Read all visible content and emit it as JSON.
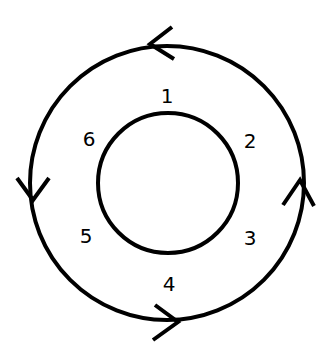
{
  "diagram": {
    "type": "concentric-cycle",
    "inner_circle": {
      "cx": 168,
      "cy": 183,
      "r": 70
    },
    "outer_circle": {
      "cx": 167,
      "cy": 183,
      "r": 137,
      "direction": "counterclockwise"
    },
    "labels": [
      {
        "text": "1",
        "x": 167,
        "y": 96
      },
      {
        "text": "2",
        "x": 250,
        "y": 141
      },
      {
        "text": "3",
        "x": 250,
        "y": 238
      },
      {
        "text": "4",
        "x": 169,
        "y": 284
      },
      {
        "text": "5",
        "x": 86,
        "y": 236
      },
      {
        "text": "6",
        "x": 89,
        "y": 139
      }
    ],
    "arrows": [
      {
        "position": "top",
        "points_toward": "left"
      },
      {
        "position": "left",
        "points_toward": "down"
      },
      {
        "position": "bottom",
        "points_toward": "right"
      },
      {
        "position": "right",
        "points_toward": "up"
      }
    ],
    "colors": {
      "stroke": "#000000",
      "background": "#ffffff"
    }
  }
}
